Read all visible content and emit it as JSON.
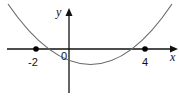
{
  "diagram": {
    "type": "parabola-graph",
    "function": "y = a(x + 2)(x - 4)",
    "axes": {
      "x_label": "x",
      "y_label": "y",
      "origin_label": "0"
    },
    "roots": [
      {
        "x": -2,
        "label": "-2"
      },
      {
        "x": 4,
        "label": "4"
      }
    ],
    "colors": {
      "axis": "#111111",
      "curve": "#666666",
      "point": "#000000"
    }
  }
}
